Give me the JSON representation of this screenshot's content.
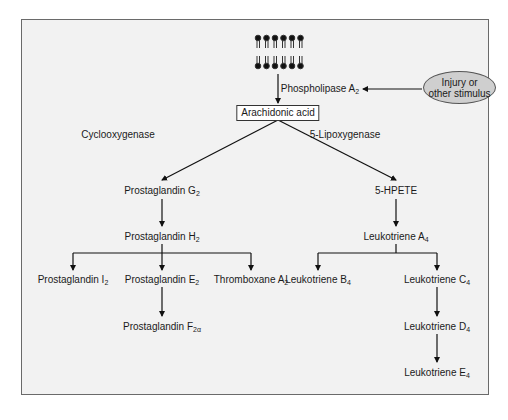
{
  "diagram": {
    "membrane": {
      "icon": "phospholipid-bilayer",
      "heads_per_layer": 6
    },
    "stimulus": {
      "line1": "Injury or",
      "line2": "other stimulus"
    },
    "enzymes": {
      "phospholipase": {
        "text": "Phospholipase A",
        "sub": "2"
      },
      "cyclooxygenase": "Cyclooxygenase",
      "lipoxygenase": "5-Lipoxygenase"
    },
    "root": "Arachidonic acid",
    "cox_branch": {
      "pg_g2": {
        "text": "Prostaglandin G",
        "sub": "2"
      },
      "pg_h2": {
        "text": "Prostaglandin H",
        "sub": "2"
      },
      "pg_i2": {
        "text": "Prostaglandin I",
        "sub": "2"
      },
      "pg_e2": {
        "text": "Prostaglandin E",
        "sub": "2"
      },
      "tx_a2": {
        "text": "Thromboxane A",
        "sub": "2"
      },
      "pg_f2a": {
        "text": "Prostaglandin F",
        "sub": "2α"
      }
    },
    "lox_branch": {
      "hpete": "5-HPETE",
      "lt_a4": {
        "text": "Leukotriene A",
        "sub": "4"
      },
      "lt_b4": {
        "text": "Leukotriene B",
        "sub": "4"
      },
      "lt_c4": {
        "text": "Leukotriene C",
        "sub": "4"
      },
      "lt_d4": {
        "text": "Leukotriene D",
        "sub": "4"
      },
      "lt_e4": {
        "text": "Leukotriene E",
        "sub": "4"
      }
    },
    "colors": {
      "frame_bg": "#f2f2f2",
      "ellipse_bg": "#cfcfcf",
      "line": "#111111"
    }
  }
}
